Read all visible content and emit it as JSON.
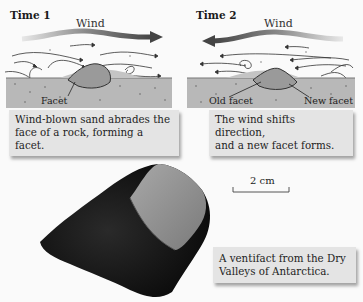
{
  "panels": [
    {
      "title": "Time 1",
      "wind_label": "Wind",
      "wind_direction": "right",
      "labels": [
        "Facet"
      ],
      "caption_line1": "Wind-blown sand abrades the",
      "caption_line2": "face of a rock, forming a facet."
    },
    {
      "title": "Time 2",
      "wind_label": "Wind",
      "wind_direction": "left",
      "labels": [
        "Old facet",
        "New facet"
      ],
      "caption_line1": "The wind shifts direction,",
      "caption_line2": "and a new facet forms."
    }
  ],
  "photo": {
    "subject": "ventifact rock",
    "scale_bar_label": "2 cm",
    "caption_line1": "A ventifact from the Dry",
    "caption_line2": "Valleys of Antarctica."
  },
  "colors": {
    "background": "#fafafa",
    "ground": "#b8b8b8",
    "rock": "#9a9a9a",
    "wind_arrow_dark": "#555555",
    "caption_box": "#e4e4e4",
    "photo_rock": "#161616",
    "photo_facet": "#8e8e8e"
  }
}
